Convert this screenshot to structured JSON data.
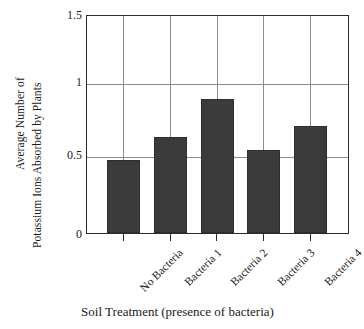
{
  "chart_data": {
    "type": "bar",
    "title": "",
    "xlabel": "Soil Treatment (presence of bacteria)",
    "ylabel": "Average Number of Potassium Ions Absorbed by Plants",
    "ylabel_lines": [
      "Average Number of",
      "Potassium Ions  Absorbed by Plants"
    ],
    "categories": [
      "No Bacteria",
      "Bacteria 1",
      "Bacteria 2",
      "Bacteria 3",
      "Bacteria 4"
    ],
    "values": [
      0.5,
      0.66,
      0.92,
      0.57,
      0.73
    ],
    "ylim": [
      0,
      1.5
    ],
    "yticks": [
      0,
      0.5,
      1,
      1.5
    ],
    "ytick_labels": [
      "0",
      "0.5",
      "1",
      "1.5"
    ],
    "grid": "horizontal-and-vertical",
    "legend": "none",
    "bar_color": "#3b3b3b",
    "grid_color": "#8c8c8c",
    "axis_color": "#2b2b2b",
    "background": "#ffffff"
  }
}
